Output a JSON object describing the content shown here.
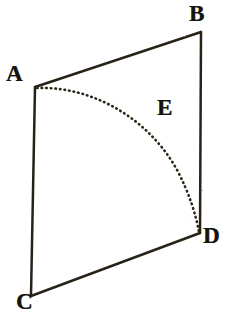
{
  "figure": {
    "kind": "geometry-diagram",
    "background_color": "#ffffff",
    "ink_color": "#272218",
    "canvas": {
      "width": 227,
      "height": 316
    },
    "labels": [
      {
        "id": "A",
        "text": "A",
        "x": 6,
        "y": 62,
        "name": "vertex-label-a"
      },
      {
        "id": "B",
        "text": "B",
        "x": 189,
        "y": 2,
        "name": "vertex-label-b"
      },
      {
        "id": "C",
        "text": "C",
        "x": 16,
        "y": 290,
        "name": "vertex-label-c"
      },
      {
        "id": "D",
        "text": "D",
        "x": 203,
        "y": 224,
        "name": "vertex-label-d"
      },
      {
        "id": "E",
        "text": "E",
        "x": 157,
        "y": 96,
        "name": "arc-label-e"
      }
    ],
    "vertices": {
      "A": {
        "x": 35,
        "y": 87
      },
      "B": {
        "x": 201,
        "y": 32
      },
      "C": {
        "x": 31,
        "y": 296
      },
      "D": {
        "x": 200,
        "y": 233
      }
    },
    "edges": [
      {
        "id": "AB",
        "from": "A",
        "to": "B",
        "style": "solid",
        "name": "edge-a-b"
      },
      {
        "id": "BD",
        "from": "B",
        "to": "D",
        "style": "solid",
        "name": "edge-b-d"
      },
      {
        "id": "DC",
        "from": "D",
        "to": "C",
        "style": "solid",
        "name": "edge-d-c"
      },
      {
        "id": "CA",
        "from": "C",
        "to": "A",
        "style": "solid",
        "name": "edge-c-a"
      }
    ],
    "arc": {
      "id": "AED",
      "from": "A",
      "to": "D",
      "label": "E",
      "style": "dotted",
      "path": "M 37 88 C 90 86, 146 116, 176 168 C 190 194, 196 216, 199 232",
      "name": "dotted-arc-a-e-d"
    }
  }
}
